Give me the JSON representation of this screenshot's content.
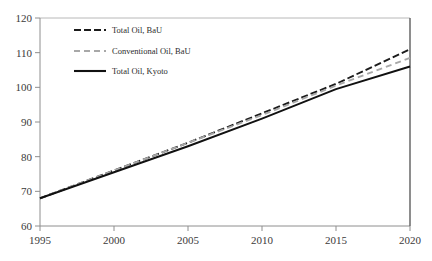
{
  "chart_data": {
    "type": "line",
    "title": "",
    "xlabel": "",
    "ylabel": "",
    "xlim": [
      1995,
      2020
    ],
    "ylim": [
      60,
      120
    ],
    "xticks": [
      1995,
      2000,
      2005,
      2010,
      2015,
      2020
    ],
    "yticks": [
      60,
      70,
      80,
      90,
      100,
      110,
      120
    ],
    "grid": false,
    "legend_position": "upper-left-inside",
    "x": [
      1995,
      2000,
      2005,
      2010,
      2015,
      2020
    ],
    "series": [
      {
        "name": "Total Oil, BaU",
        "style": "dash-dot",
        "color": "#1c1c1c",
        "values": [
          68.0,
          76.0,
          84.0,
          92.5,
          101.0,
          111.0
        ]
      },
      {
        "name": "Conventional Oil, BaU",
        "style": "dashed",
        "color": "#a8a8a8",
        "values": [
          68.0,
          76.0,
          84.0,
          92.0,
          100.5,
          108.5
        ]
      },
      {
        "name": "Total Oil, Kyoto",
        "style": "solid",
        "color": "#111111",
        "values": [
          68.0,
          75.5,
          83.0,
          91.0,
          99.5,
          106.0
        ]
      }
    ]
  },
  "axes": {
    "x_tick_labels": [
      "1995",
      "2000",
      "2005",
      "2010",
      "2015",
      "2020"
    ],
    "y_tick_labels": [
      "60",
      "70",
      "80",
      "90",
      "100",
      "110",
      "120"
    ]
  },
  "legend": {
    "items": [
      {
        "label": "Total Oil, BaU",
        "swatch": "dash-dot-swatch"
      },
      {
        "label": "Conventional Oil, BaU",
        "swatch": "dashed-swatch"
      },
      {
        "label": "Total Oil, Kyoto",
        "swatch": "solid-swatch"
      }
    ]
  },
  "colors": {
    "frame": "#9a9a9a",
    "frame_strong": "#6a6a6a",
    "series_dark": "#1c1c1c",
    "series_gray": "#a8a8a8",
    "series_solid": "#111111"
  }
}
